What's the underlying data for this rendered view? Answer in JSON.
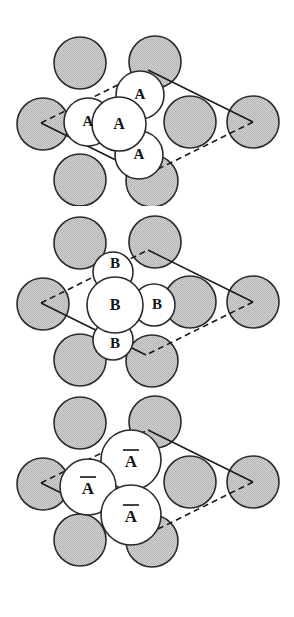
{
  "figure": {
    "type": "crystal-stacking-diagram",
    "background_color": "#ffffff",
    "panel_count": 3,
    "substrate_atom_color": "#c9c9c9",
    "adsorbate_atom_color": "#ffffff",
    "outline_color": "#2b2b2b",
    "unit_cell_color": "#1a1a1a",
    "label_color": "#141414"
  },
  "panels": [
    {
      "id": "panel-a",
      "name": "stacking-layer-A",
      "label_text": "A",
      "label_overline": false,
      "adsorbate_count": 4,
      "labels": [
        "A",
        "A",
        "A",
        "A"
      ]
    },
    {
      "id": "panel-b",
      "name": "stacking-layer-B",
      "label_text": "B",
      "label_overline": false,
      "adsorbate_count": 4,
      "labels": [
        "B",
        "B",
        "B",
        "B"
      ]
    },
    {
      "id": "panel-abar",
      "name": "stacking-layer-A-bar",
      "label_text": "A",
      "label_overline": true,
      "adsorbate_count": 3,
      "labels": [
        "A",
        "A",
        "A"
      ]
    }
  ],
  "panel_a": {
    "substrate_atoms": [
      {
        "cx": 80,
        "cy": 63,
        "r": 26
      },
      {
        "cx": 155,
        "cy": 62,
        "r": 26
      },
      {
        "cx": 43,
        "cy": 124,
        "r": 26
      },
      {
        "cx": 190,
        "cy": 122,
        "r": 26
      },
      {
        "cx": 253,
        "cy": 122,
        "r": 26
      },
      {
        "cx": 80,
        "cy": 180,
        "r": 26
      },
      {
        "cx": 152,
        "cy": 181,
        "r": 26
      }
    ],
    "adsorbate_atoms": [
      {
        "cx": 140,
        "cy": 95,
        "r": 24,
        "label": "A"
      },
      {
        "cx": 88,
        "cy": 122,
        "r": 24,
        "label": "A"
      },
      {
        "cx": 119,
        "cy": 124,
        "r": 27,
        "label": "A"
      },
      {
        "cx": 139,
        "cy": 155,
        "r": 24,
        "label": "A"
      }
    ],
    "unit_cell": {
      "vertices": [
        [
          148,
          70
        ],
        [
          253,
          122
        ],
        [
          146,
          175
        ],
        [
          41,
          123
        ]
      ],
      "solid_edges": [
        [
          [
            148,
            70
          ],
          [
            253,
            122
          ]
        ],
        [
          [
            146,
            175
          ],
          [
            41,
            123
          ]
        ]
      ],
      "dashed_edges": [
        [
          [
            253,
            122
          ],
          [
            146,
            175
          ]
        ],
        [
          [
            41,
            123
          ],
          [
            148,
            70
          ]
        ]
      ]
    }
  },
  "panel_b": {
    "substrate_atoms": [
      {
        "cx": 80,
        "cy": 243,
        "r": 26
      },
      {
        "cx": 155,
        "cy": 242,
        "r": 26
      },
      {
        "cx": 43,
        "cy": 304,
        "r": 26
      },
      {
        "cx": 190,
        "cy": 302,
        "r": 26
      },
      {
        "cx": 253,
        "cy": 302,
        "r": 26
      },
      {
        "cx": 80,
        "cy": 360,
        "r": 26
      },
      {
        "cx": 152,
        "cy": 361,
        "r": 26
      }
    ],
    "adsorbate_atoms": [
      {
        "cx": 113,
        "cy": 272,
        "r": 20,
        "label": "B"
      },
      {
        "cx": 115,
        "cy": 305,
        "r": 28,
        "label": "B"
      },
      {
        "cx": 154,
        "cy": 305,
        "r": 21,
        "label": "B"
      },
      {
        "cx": 113,
        "cy": 340,
        "r": 20,
        "label": "B"
      }
    ],
    "unit_cell": {
      "vertices": [
        [
          148,
          250
        ],
        [
          253,
          302
        ],
        [
          146,
          355
        ],
        [
          41,
          303
        ]
      ],
      "solid_edges": [
        [
          [
            148,
            250
          ],
          [
            253,
            302
          ]
        ],
        [
          [
            146,
            355
          ],
          [
            41,
            303
          ]
        ]
      ],
      "dashed_edges": [
        [
          [
            253,
            302
          ],
          [
            146,
            355
          ]
        ],
        [
          [
            41,
            303
          ],
          [
            148,
            250
          ]
        ]
      ]
    }
  },
  "panel_abar": {
    "substrate_atoms": [
      {
        "cx": 80,
        "cy": 423,
        "r": 26
      },
      {
        "cx": 155,
        "cy": 422,
        "r": 26
      },
      {
        "cx": 43,
        "cy": 484,
        "r": 26
      },
      {
        "cx": 190,
        "cy": 482,
        "r": 26
      },
      {
        "cx": 253,
        "cy": 482,
        "r": 26
      },
      {
        "cx": 80,
        "cy": 540,
        "r": 26
      },
      {
        "cx": 152,
        "cy": 541,
        "r": 26
      }
    ],
    "adsorbate_atoms": [
      {
        "cx": 131,
        "cy": 460,
        "r": 30,
        "label": "A"
      },
      {
        "cx": 88,
        "cy": 487,
        "r": 28,
        "label": "A"
      },
      {
        "cx": 131,
        "cy": 515,
        "r": 30,
        "label": "A"
      }
    ],
    "unit_cell": {
      "vertices": [
        [
          148,
          430
        ],
        [
          253,
          482
        ],
        [
          146,
          535
        ],
        [
          41,
          483
        ]
      ],
      "solid_edges": [
        [
          [
            148,
            430
          ],
          [
            253,
            482
          ]
        ],
        [
          [
            146,
            535
          ],
          [
            41,
            483
          ]
        ]
      ],
      "dashed_edges": [
        [
          [
            253,
            482
          ],
          [
            146,
            535
          ]
        ],
        [
          [
            41,
            483
          ],
          [
            148,
            430
          ]
        ]
      ]
    }
  }
}
